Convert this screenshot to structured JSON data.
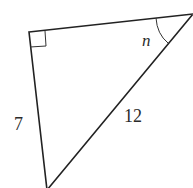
{
  "diagram": {
    "type": "right-triangle",
    "vertices": {
      "right_angle": {
        "x": 29,
        "y": 32
      },
      "top_right": {
        "x": 193,
        "y": 14
      },
      "bottom": {
        "x": 47,
        "y": 190
      }
    },
    "labels": {
      "left_side": "7",
      "hypotenuse": "12",
      "angle": "n"
    },
    "markers": {
      "right_angle_box": true,
      "angle_arc_at": "top_right"
    },
    "stroke_color": "#222222"
  }
}
